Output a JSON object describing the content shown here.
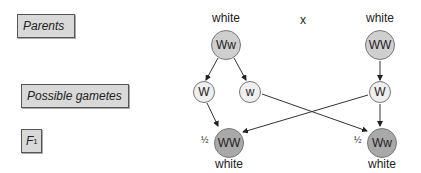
{
  "row_labels": {
    "parents": "Parents",
    "gametes": "Possible gametes",
    "f1_main": "F",
    "f1_sub": "1"
  },
  "parents": {
    "left": {
      "phenotype": "white",
      "genotype": "Ww"
    },
    "cross_symbol": "x",
    "right": {
      "phenotype": "white",
      "genotype": "WW"
    }
  },
  "gametes": [
    {
      "allele": "W",
      "from": "left"
    },
    {
      "allele": "w",
      "from": "left"
    },
    {
      "allele": "W",
      "from": "right"
    }
  ],
  "f1": [
    {
      "fraction": "½",
      "genotype": "WW",
      "phenotype": "white"
    },
    {
      "fraction": "½",
      "genotype": "Ww",
      "phenotype": "white"
    }
  ],
  "colors": {
    "parent_fill": "#cfcfcf",
    "gamete_fill": "#efefef",
    "f1_fill": "#a9a9a9",
    "label_fill": "#d9d9d9"
  }
}
